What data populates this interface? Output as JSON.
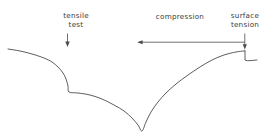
{
  "figure": {
    "title": "",
    "background_color": "#ffffff",
    "line_color": "#4b4b4b",
    "text_color": "#3a3a3a",
    "width": 269,
    "height": 137,
    "annotations": {
      "tensile_test": "tensile\ntest",
      "compression": "compression",
      "surface_tension": "surface\ntension"
    }
  },
  "chart_data": {
    "type": "line",
    "title": "",
    "xlabel": "",
    "ylabel": "",
    "grid": false,
    "legend": "none",
    "axis_visible": false,
    "xlim": [
      0,
      269
    ],
    "ylim": [
      137,
      0
    ],
    "annotations": [
      {
        "name": "tensile-test",
        "text": "tensile test",
        "text_lines": [
          "tensile",
          "test"
        ],
        "text_x": 76,
        "text_y": 20,
        "marker": "down-arrow",
        "arrow_from": [
          76,
          33
        ],
        "arrow_to": [
          76,
          46
        ]
      },
      {
        "name": "compression",
        "text": "compression",
        "text_lines": [
          "compression"
        ],
        "text_x": 180,
        "text_y": 18,
        "marker": "span-arrow",
        "arrow_from": [
          138,
          42
        ],
        "arrow_to": [
          245,
          42
        ],
        "arrow_end_drop_to": [
          245,
          50
        ]
      },
      {
        "name": "surface-tension",
        "text": "surface tension",
        "text_lines": [
          "surface",
          "tension"
        ],
        "text_x": 245,
        "text_y": 20,
        "marker": "down-arrow",
        "arrow_from": [
          245,
          33
        ],
        "arrow_to": [
          245,
          50
        ]
      }
    ],
    "series": [
      {
        "name": "force-trace",
        "description": "Force / signal trace: slow decay, abrupt tensile drop, long shallow decline to sharp minimum, then recovery rise ending in a surface-tension step.",
        "points": [
          [
            8,
            49
          ],
          [
            20,
            51
          ],
          [
            32,
            54
          ],
          [
            44,
            58
          ],
          [
            52,
            62
          ],
          [
            58,
            67
          ],
          [
            63,
            73
          ],
          [
            66,
            79
          ],
          [
            68,
            86
          ],
          [
            69,
            92
          ],
          [
            78,
            93
          ],
          [
            90,
            95
          ],
          [
            102,
            99
          ],
          [
            114,
            105
          ],
          [
            124,
            111
          ],
          [
            132,
            118
          ],
          [
            138,
            125
          ],
          [
            142,
            131
          ],
          [
            146,
            122
          ],
          [
            151,
            112
          ],
          [
            158,
            102
          ],
          [
            166,
            93
          ],
          [
            176,
            84
          ],
          [
            188,
            75
          ],
          [
            200,
            67
          ],
          [
            212,
            60
          ],
          [
            224,
            55
          ],
          [
            236,
            52
          ],
          [
            244,
            51
          ],
          [
            245,
            51
          ],
          [
            245,
            60
          ],
          [
            257,
            60
          ]
        ]
      }
    ]
  }
}
